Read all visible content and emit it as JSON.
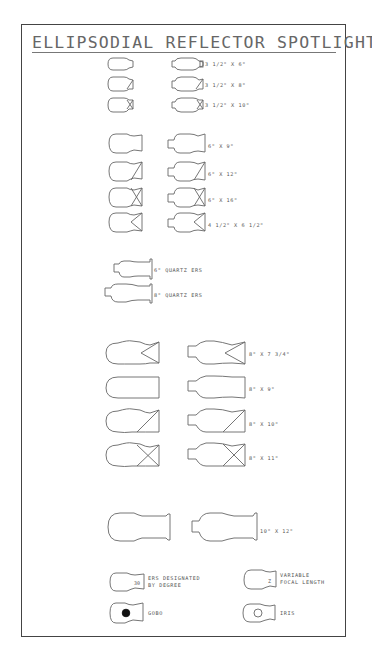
{
  "title": "ELLIPSODIAL REFLECTOR SPOTLIGHTS",
  "sections": {
    "small": [
      {
        "label": "3 1/2\" X 6\"",
        "beam": "none"
      },
      {
        "label": "3 1/2\" X 8\"",
        "beam": "single-diagonal"
      },
      {
        "label": "3 1/2\" X 10\"",
        "beam": "cross"
      }
    ],
    "six_inch": [
      {
        "label": "6\" X 9\"",
        "beam": "none"
      },
      {
        "label": "6\" X 12\"",
        "beam": "single-diagonal"
      },
      {
        "label": "6\" X 16\"",
        "beam": "cross"
      },
      {
        "label": "4 1/2\" X 6 1/2\"",
        "beam": "chevron"
      }
    ],
    "quartz": [
      {
        "label": "6\" QUARTZ ERS"
      },
      {
        "label": "8\" QUARTZ ERS"
      }
    ],
    "eight_inch": [
      {
        "label": "8\" X 7 3/4\"",
        "beam": "chevron"
      },
      {
        "label": "8\" X 9\"",
        "beam": "none"
      },
      {
        "label": "8\" X 10\"",
        "beam": "single-diagonal"
      },
      {
        "label": "8\" X 11\"",
        "beam": "cross"
      }
    ],
    "ten_inch": [
      {
        "label": "10\" X 12\""
      }
    ]
  },
  "legend": {
    "degree": {
      "symbol_text": "30",
      "label_line1": "ERS DESIGNATED",
      "label_line2": "BY DEGREE"
    },
    "variable": {
      "symbol_text": "Z",
      "label_line1": "VARIABLE",
      "label_line2": "FOCAL LENGTH"
    },
    "gobo": {
      "label": "GOBO"
    },
    "iris": {
      "label": "IRIS"
    }
  },
  "colors": {
    "line": "#666666",
    "frame": "#444444",
    "text": "#555555"
  }
}
